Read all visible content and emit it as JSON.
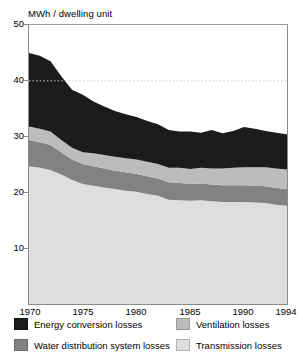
{
  "chart_data": {
    "type": "area",
    "title": "",
    "ylabel": "MWh / dwelling unit",
    "xlabel": "",
    "stacked": true,
    "grid": "dotted horizontal line at y = 40",
    "legend_position": "bottom",
    "ylim": [
      0,
      50
    ],
    "yticks": [
      10,
      20,
      30,
      40,
      50
    ],
    "xlim": [
      1970,
      1994
    ],
    "xticks": [
      1970,
      1975,
      1980,
      1985,
      1990,
      1994
    ],
    "xtick_labels": [
      "1970",
      "1975",
      "1980",
      "1985",
      "1990",
      "1994"
    ],
    "ytick_labels": [
      "10",
      "20",
      "30",
      "40",
      "50"
    ],
    "x": [
      1970,
      1971,
      1972,
      1973,
      1974,
      1975,
      1976,
      1977,
      1978,
      1979,
      1980,
      1981,
      1982,
      1983,
      1984,
      1985,
      1986,
      1987,
      1988,
      1989,
      1990,
      1991,
      1992,
      1993,
      1994
    ],
    "series": [
      {
        "name": "Transmission losses",
        "color": "#dedede",
        "values": [
          24.7,
          24.4,
          24.0,
          23.2,
          22.2,
          21.5,
          21.2,
          20.9,
          20.6,
          20.3,
          20.1,
          19.7,
          19.4,
          18.7,
          18.6,
          18.5,
          18.6,
          18.4,
          18.3,
          18.3,
          18.3,
          18.2,
          18.1,
          17.8,
          17.6
        ]
      },
      {
        "name": "Water distribution system losses",
        "color": "#828282",
        "values": [
          4.7,
          4.6,
          4.5,
          4.0,
          3.7,
          3.6,
          3.5,
          3.4,
          3.3,
          3.3,
          3.2,
          3.2,
          3.1,
          3.1,
          3.1,
          3.0,
          3.0,
          3.0,
          3.0,
          3.0,
          3.0,
          3.0,
          3.0,
          3.0,
          3.0
        ]
      },
      {
        "name": "Ventilation losses",
        "color": "#bcbcbc",
        "values": [
          2.4,
          2.4,
          2.4,
          2.2,
          2.1,
          2.1,
          2.3,
          2.4,
          2.5,
          2.5,
          2.6,
          2.6,
          2.6,
          2.6,
          2.7,
          2.7,
          2.8,
          2.9,
          3.0,
          3.1,
          3.2,
          3.3,
          3.4,
          3.5,
          3.5
        ]
      },
      {
        "name": "Energy conversion losses",
        "color": "#1b1b1b",
        "values": [
          13.2,
          13.1,
          12.6,
          11.4,
          10.4,
          10.3,
          9.3,
          8.7,
          8.2,
          7.9,
          7.6,
          7.3,
          7.1,
          6.8,
          6.5,
          6.7,
          6.3,
          6.9,
          6.3,
          6.6,
          7.2,
          6.9,
          6.5,
          6.4,
          6.3
        ]
      }
    ],
    "stack_tops": {
      "transmission": [
        24.7,
        24.4,
        24.0,
        23.2,
        22.2,
        21.5,
        21.2,
        20.9,
        20.6,
        20.3,
        20.1,
        19.7,
        19.4,
        18.7,
        18.6,
        18.5,
        18.6,
        18.4,
        18.3,
        18.3,
        18.3,
        18.2,
        18.1,
        17.8,
        17.6
      ],
      "water": [
        29.4,
        29.0,
        28.5,
        27.2,
        25.9,
        25.1,
        24.7,
        24.3,
        23.9,
        23.6,
        23.3,
        22.9,
        22.5,
        21.8,
        21.7,
        21.5,
        21.6,
        21.4,
        21.3,
        21.3,
        21.3,
        21.2,
        21.1,
        20.8,
        20.6
      ],
      "ventilation": [
        31.8,
        31.4,
        30.9,
        29.4,
        28.0,
        27.2,
        27.0,
        26.7,
        26.4,
        26.1,
        25.9,
        25.5,
        25.1,
        24.4,
        24.4,
        24.2,
        24.4,
        24.3,
        24.3,
        24.4,
        24.5,
        24.5,
        24.5,
        24.3,
        24.1
      ],
      "total": [
        45.0,
        44.5,
        43.5,
        40.8,
        38.4,
        37.5,
        36.3,
        35.4,
        34.6,
        34.0,
        33.5,
        32.8,
        32.2,
        31.2,
        30.9,
        30.9,
        30.7,
        31.2,
        30.6,
        31.0,
        31.7,
        31.4,
        31.0,
        30.7,
        30.4
      ]
    },
    "gridline_values": [
      40
    ]
  },
  "axis": {
    "y_title": "MWh / dwelling unit",
    "y_ticks": [
      "50",
      "40",
      "30",
      "20",
      "10"
    ],
    "x_ticks": [
      "1970",
      "1975",
      "1980",
      "1985",
      "1990",
      "1994"
    ]
  },
  "legend": {
    "items": [
      {
        "label": "Energy conversion losses",
        "swatch": "black-swatch"
      },
      {
        "label": "Water distribution system losses",
        "swatch": "dark-gray-swatch"
      },
      {
        "label": "Ventilation losses",
        "swatch": "mid-gray-swatch"
      },
      {
        "label": "Transmission losses",
        "swatch": "light-gray-swatch"
      }
    ]
  },
  "colors": {
    "energy_conversion": "#1b1b1b",
    "water_distribution": "#828282",
    "ventilation": "#bcbcbc",
    "transmission": "#dedede",
    "frame": "#8a8a8a",
    "background": "#ffffff"
  }
}
